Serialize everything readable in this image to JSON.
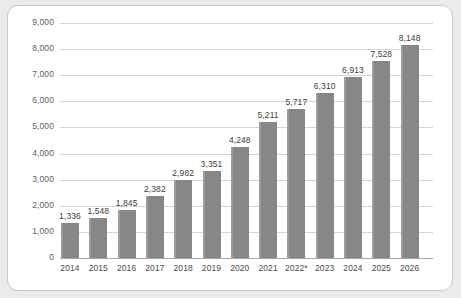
{
  "chart_data": {
    "type": "bar",
    "title": "",
    "subtitle": "",
    "xlabel": "",
    "ylabel": "",
    "categories": [
      "2014",
      "2015",
      "2016",
      "2017",
      "2018",
      "2019",
      "2020",
      "2021",
      "2022*",
      "2023",
      "2024",
      "2025",
      "2026"
    ],
    "values": [
      1336,
      1548,
      1845,
      2382,
      2982,
      3351,
      4248,
      5211,
      5717,
      6310,
      6913,
      7528,
      8148
    ],
    "value_labels": [
      "1,336",
      "1,548",
      "1,845",
      "2,382",
      "2,982",
      "3,351",
      "4,248",
      "5,211",
      "5,717",
      "6,310",
      "6,913",
      "7,528",
      "8,148"
    ],
    "ylim": [
      0,
      9000
    ],
    "ytick_values": [
      0,
      1000,
      2000,
      3000,
      4000,
      5000,
      6000,
      7000,
      8000,
      9000
    ],
    "ytick_labels": [
      "0",
      "1,000",
      "2,000",
      "3,000",
      "4,000",
      "5,000",
      "6,000",
      "7,000",
      "8,000",
      "9,000"
    ],
    "grid": true,
    "legend": false,
    "bar_color": "#8a8a8a",
    "grid_color": "#d4d4d4",
    "axis_color": "#a8a8a8",
    "background_color": "#ffffff",
    "page_background_color": "#ebebeb"
  }
}
